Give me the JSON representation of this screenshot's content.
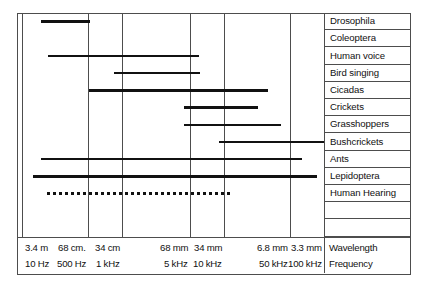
{
  "figure": {
    "axis_titles": {
      "wavelength": "Wavelength",
      "frequency": "Frequency"
    },
    "rows": [
      {
        "label": "Drosophila"
      },
      {
        "label": "Coleoptera"
      },
      {
        "label": "Human voice"
      },
      {
        "label": "Bird singing"
      },
      {
        "label": "Cicadas"
      },
      {
        "label": "Crickets"
      },
      {
        "label": "Grasshoppers"
      },
      {
        "label": "Bushcrickets"
      },
      {
        "label": "Ants"
      },
      {
        "label": "Lepidoptera"
      },
      {
        "label": "Human Hearing"
      },
      {
        "label": ""
      },
      {
        "label": ""
      }
    ],
    "axis_ticks": [
      {
        "wavelength": "3.4 m",
        "frequency": "10 Hz"
      },
      {
        "wavelength": "68 cm.",
        "frequency": "500 Hz"
      },
      {
        "wavelength": "34 cm",
        "frequency": "1 kHz"
      },
      {
        "wavelength": "68 mm",
        "frequency": "5 kHz"
      },
      {
        "wavelength": "34 mm",
        "frequency": "10 kHz"
      },
      {
        "wavelength": "6.8 mm",
        "frequency": "50 kHz"
      },
      {
        "wavelength": "3.3 mm",
        "frequency": "100 kHz"
      }
    ]
  },
  "chart_data": {
    "type": "bar",
    "orientation": "horizontal",
    "xlabel": "Frequency",
    "xlabel_secondary": "Wavelength",
    "xscale": "log",
    "xlim": [
      10,
      100000
    ],
    "grid": true,
    "legend": "none",
    "xticks_frequency": [
      "10 Hz",
      "500 Hz",
      "1 kHz",
      "5 kHz",
      "10 kHz",
      "50 kHz",
      "100 kHz"
    ],
    "xticks_frequency_hz": [
      10,
      500,
      1000,
      5000,
      10000,
      50000,
      100000
    ],
    "xticks_wavelength": [
      "3.4 m",
      "68 cm.",
      "34 cm",
      "68 mm",
      "34 mm",
      "6.8 mm",
      "3.3 mm"
    ],
    "categories": [
      "Drosophila",
      "Coleoptera",
      "Human voice",
      "Bird singing",
      "Cicadas",
      "Crickets",
      "Grasshoppers",
      "Bushcrickets",
      "Ants",
      "Lepidoptera",
      "Human Hearing"
    ],
    "ranges_hz": [
      {
        "name": "Drosophila",
        "low": 100,
        "high": 550,
        "style": "solid"
      },
      {
        "name": "Coleoptera",
        "low": null,
        "high": null,
        "style": "none"
      },
      {
        "name": "Human voice",
        "low": 140,
        "high": 5800,
        "style": "solid"
      },
      {
        "name": "Bird singing",
        "low": 800,
        "high": 5900,
        "style": "solid"
      },
      {
        "name": "Cicadas",
        "low": 500,
        "high": 31000,
        "style": "solid"
      },
      {
        "name": "Crickets",
        "low": 4300,
        "high": 25000,
        "style": "solid"
      },
      {
        "name": "Grasshoppers",
        "low": 4300,
        "high": 42000,
        "style": "solid"
      },
      {
        "name": "Bushcrickets",
        "low": 9500,
        "high": 100000,
        "style": "solid"
      },
      {
        "name": "Ants",
        "low": 100,
        "high": 62000,
        "style": "solid"
      },
      {
        "name": "Lepidoptera",
        "low": 60,
        "high": 88000,
        "style": "solid"
      },
      {
        "name": "Human Hearing",
        "low": 200,
        "high": 11000,
        "style": "dotted"
      }
    ],
    "bar_geometry_px": [
      {
        "name": "Drosophila",
        "x1": 24.0,
        "x2": 73.0,
        "row": 0,
        "style": "solid"
      },
      {
        "name": "Coleoptera",
        "x1": null,
        "x2": null,
        "row": 1,
        "style": "none"
      },
      {
        "name": "Human voice",
        "x1": 31.0,
        "x2": 182.0,
        "row": 2,
        "style": "solid"
      },
      {
        "name": "Bird singing",
        "x1": 97.0,
        "x2": 183.0,
        "row": 3,
        "style": "solid"
      },
      {
        "name": "Cicadas",
        "x1": 72.0,
        "x2": 251.0,
        "row": 4,
        "style": "solid"
      },
      {
        "name": "Crickets",
        "x1": 167.0,
        "x2": 241.0,
        "row": 5,
        "style": "solid"
      },
      {
        "name": "Grasshoppers",
        "x1": 167.0,
        "x2": 264.0,
        "row": 6,
        "style": "solid"
      },
      {
        "name": "Bushcrickets",
        "x1": 202.0,
        "x2": 307.0,
        "row": 7,
        "style": "solid"
      },
      {
        "name": "Ants",
        "x1": 24.0,
        "x2": 285.0,
        "row": 8,
        "style": "solid"
      },
      {
        "name": "Lepidoptera",
        "x1": 16.0,
        "x2": 300.0,
        "row": 9,
        "style": "solid"
      },
      {
        "name": "Human Hearing",
        "x1": 30.0,
        "x2": 213.0,
        "row": 10,
        "style": "dotted"
      }
    ],
    "gridline_x_px": [
      5.0,
      71.0,
      105.0,
      173.0,
      207.0,
      273.0,
      307.0
    ],
    "row_height_px": 17.2,
    "colors": {
      "bar": "#111111",
      "grid": "#4d4d4d",
      "frame": "#4d4d4d",
      "background": "#ffffff"
    }
  }
}
